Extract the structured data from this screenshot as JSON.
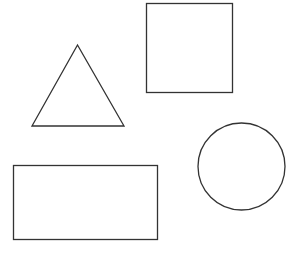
{
  "canvas": {
    "width": 299,
    "height": 263,
    "background": "#ffffff",
    "stroke_color": "#333333"
  },
  "shapes": [
    {
      "type": "square",
      "x": 146.5,
      "y": 3.5,
      "width": 86,
      "height": 89
    },
    {
      "type": "triangle",
      "points": "77.5,45 32,126 124,126"
    },
    {
      "type": "circle",
      "cx": 241.5,
      "cy": 166.5,
      "r": 43.5
    },
    {
      "type": "rectangle",
      "x": 13.5,
      "y": 165.5,
      "width": 144,
      "height": 74
    }
  ]
}
